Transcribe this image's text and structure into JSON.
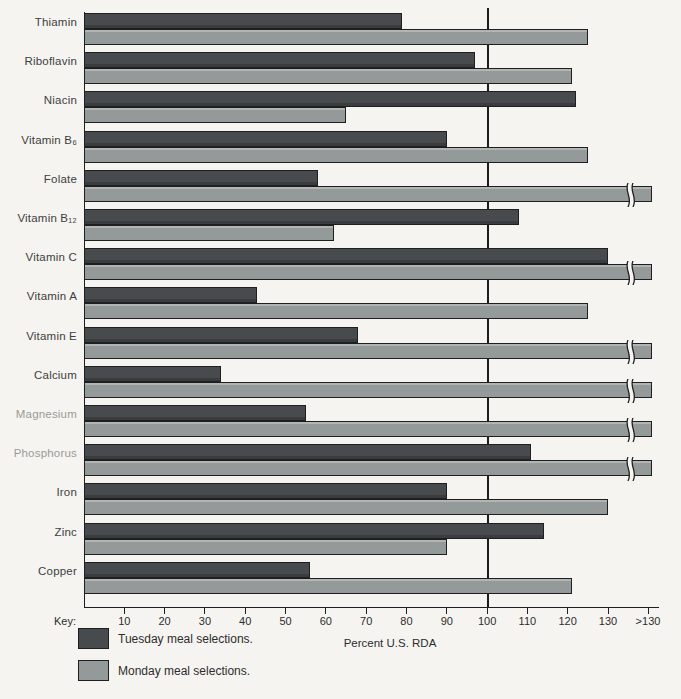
{
  "chart_data": {
    "type": "bar",
    "orientation": "horizontal",
    "title": "",
    "xlabel": "Percent U.S. RDA",
    "xlim": [
      0,
      140
    ],
    "x_ticks": [
      10,
      20,
      30,
      40,
      50,
      60,
      70,
      80,
      90,
      100,
      110,
      120,
      130,
      ">130"
    ],
    "reference_line_x": 100,
    "grid": "off",
    "categories": [
      "Thiamin",
      "Riboflavin",
      "Niacin",
      "Vitamin B₆",
      "Folate",
      "Vitamin B₁₂",
      "Vitamin C",
      "Vitamin A",
      "Vitamin E",
      "Calcium",
      "Magnesium",
      "Phosphorus",
      "Iron",
      "Zinc",
      "Copper"
    ],
    "faded_category_indices": [
      10,
      11
    ],
    "series": [
      {
        "name": "Tuesday meal selections.",
        "color": "#474b4e",
        "values": [
          79,
          97,
          122,
          90,
          58,
          108,
          130,
          43,
          68,
          34,
          55,
          111,
          90,
          114,
          56
        ]
      },
      {
        "name": "Monday meal selections.",
        "color": "#949a99",
        "values": [
          125,
          121,
          65,
          125,
          ">130",
          62,
          ">130",
          125,
          ">130",
          ">130",
          ">130",
          ">130",
          130,
          90,
          121
        ]
      }
    ],
    "overflow_value_label": ">130",
    "legend": {
      "key_label": "Key:",
      "position": "bottom-left"
    }
  }
}
